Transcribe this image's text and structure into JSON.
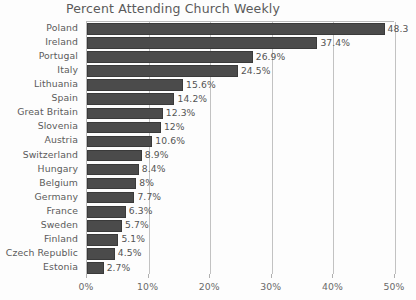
{
  "chart_data": {
    "type": "bar",
    "orientation": "horizontal",
    "title": "Percent Attending Church Weekly",
    "xlabel": "",
    "ylabel": "",
    "xlim": [
      0,
      50
    ],
    "grid": "vertical",
    "legend": "none",
    "categories": [
      "Poland",
      "Ireland",
      "Portugal",
      "Italy",
      "Lithuania",
      "Spain",
      "Great Britain",
      "Slovenia",
      "Austria",
      "Switzerland",
      "Hungary",
      "Belgium",
      "Germany",
      "France",
      "Sweden",
      "Finland",
      "Czech Republic",
      "Estonia"
    ],
    "values": [
      48.3,
      37.4,
      26.9,
      24.5,
      15.6,
      14.2,
      12.3,
      12,
      10.6,
      8.9,
      8.4,
      8,
      7.7,
      6.3,
      5.7,
      5.1,
      4.5,
      2.7
    ],
    "data_labels": [
      "48.3",
      "37.4%",
      "26.9%",
      "24.5%",
      "15.6%",
      "14.2%",
      "12.3%",
      "12%",
      "10.6%",
      "8.9%",
      "8.4%",
      "8%",
      "7.7%",
      "6.3%",
      "5.7%",
      "5.1%",
      "4.5%",
      "2.7%"
    ],
    "xticks": [
      0,
      10,
      20,
      30,
      40,
      50
    ],
    "xtick_labels": [
      "0%",
      "10%",
      "20%",
      "30%",
      "40%",
      "50%"
    ],
    "colors": {
      "bar_fill": "#4b4b4b",
      "bar_edge": "#3a3a3a",
      "gridline": "#c2c2c2",
      "axis": "#b9b9b9",
      "text": "#545454",
      "background": "#fdfdfd"
    }
  }
}
